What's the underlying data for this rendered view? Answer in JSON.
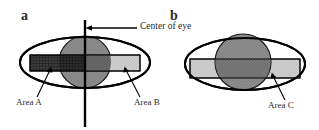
{
  "figure": {
    "type": "diagram",
    "background_color": "#ffffff",
    "stroke_color": "#000000"
  },
  "panels": [
    {
      "letter": "a",
      "name": "panel-a",
      "ellipse": {
        "cx": 85,
        "cy": 62.5,
        "rx": 65,
        "ry": 25.5
      },
      "circle": {
        "cx": 85,
        "cy": 62,
        "r": 26,
        "fill": "#8f8f8f"
      },
      "center_line": {
        "x": 85,
        "y1": 20,
        "y2": 127
      },
      "callout": {
        "text": "Center of eye",
        "x": 139,
        "y": 26
      },
      "areas": [
        {
          "label": "Area A",
          "fill": "#3c3c3c",
          "x": 30,
          "y": 55,
          "w": 55,
          "h": 16
        },
        {
          "label": "Area B",
          "fill": "#cacaca",
          "x": 85,
          "y": 55,
          "w": 55,
          "h": 16
        }
      ]
    },
    {
      "letter": "b",
      "name": "panel-b",
      "ellipse": {
        "cx": 245,
        "cy": 64,
        "rx": 60,
        "ry": 26
      },
      "circle": {
        "cx": 243,
        "cy": 62,
        "r": 28,
        "fill": "#8f8f8f"
      },
      "areas": [
        {
          "label": "Area C",
          "fill": "#cacaca",
          "x": 190,
          "y": 60,
          "w": 110,
          "h": 18
        }
      ]
    }
  ],
  "labels": {
    "panel_a_letter": "a",
    "panel_b_letter": "b",
    "center_of_eye": "Center of eye",
    "area_a": "Area A",
    "area_b": "Area B",
    "area_c": "Area C"
  },
  "colors": {
    "dark_gray": "#3c3c3c",
    "mid_gray": "#8f8f8f",
    "light_gray": "#cacaca",
    "outline": "#000000",
    "text": "#2a2a2a"
  }
}
